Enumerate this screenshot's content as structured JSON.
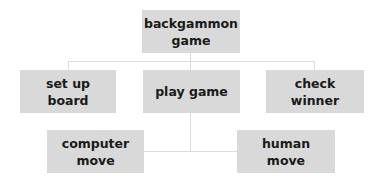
{
  "diagram": {
    "type": "hierarchy",
    "root": {
      "label": "backgammon\ngame",
      "label_lines": [
        "backgammon",
        "game"
      ]
    },
    "level1": [
      {
        "label": "set up board"
      },
      {
        "label": "play game"
      },
      {
        "label": "check winner"
      }
    ],
    "level2": [
      {
        "label_lines": [
          "computer",
          "move"
        ],
        "parent": "play game"
      },
      {
        "label_lines": [
          "human",
          "move"
        ],
        "parent": "play game"
      }
    ],
    "colors": {
      "node_fill": "#d9d9d9",
      "connector": "#dcdcdc",
      "text": "#1a1a1a"
    }
  }
}
